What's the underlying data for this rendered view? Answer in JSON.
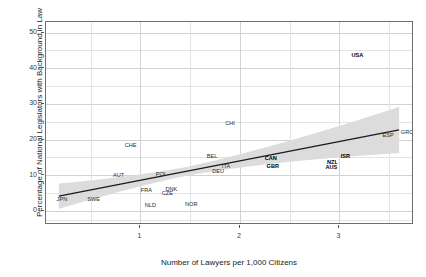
{
  "chart_data": {
    "type": "scatter",
    "title": "",
    "xlabel": "Number of Lawyers per 1,000 Citizens",
    "ylabel": "Percentage of National Legislators with Background in Law",
    "xlim": [
      0.05,
      3.75
    ],
    "ylim": [
      -4,
      53
    ],
    "xticks": [
      1,
      2,
      3
    ],
    "yticks": [
      0,
      10,
      20,
      30,
      40,
      50
    ],
    "xtick_labels": [
      "1",
      "2",
      "3"
    ],
    "ytick_labels": [
      "0",
      "10",
      "20",
      "30",
      "40",
      "50"
    ],
    "grid": true,
    "legend": "none",
    "point_style": "text-labels",
    "fit_line": {
      "type": "linear",
      "x": [
        0.18,
        3.62
      ],
      "y": [
        3.6,
        22.4
      ],
      "color": "#1a1a1a",
      "confidence_band": true,
      "band_color": "#d8d8d8"
    },
    "points": [
      {
        "label": "JPN",
        "x": 0.21,
        "y": 3.1,
        "bold": false
      },
      {
        "label": "SWE",
        "x": 0.53,
        "y": 3.0,
        "bold": false
      },
      {
        "label": "AUT",
        "x": 0.78,
        "y": 9.8,
        "bold": false
      },
      {
        "label": "CHE",
        "x": 0.9,
        "y": 18.1,
        "bold": false
      },
      {
        "label": "FRA",
        "x": 1.06,
        "y": 5.5,
        "bold": false
      },
      {
        "label": "NLD",
        "x": 1.1,
        "y": 1.4,
        "bold": false
      },
      {
        "label": "POL",
        "x": 1.21,
        "y": 9.9,
        "bold": false
      },
      {
        "label": "CZE",
        "x": 1.27,
        "y": 4.8,
        "bold": false
      },
      {
        "label": "DNK",
        "x": 1.31,
        "y": 5.7,
        "bold": false
      },
      {
        "label": "NOR",
        "x": 1.51,
        "y": 1.6,
        "bold": false
      },
      {
        "label": "BEL",
        "x": 1.72,
        "y": 15.2,
        "bold": false
      },
      {
        "label": "DEU",
        "x": 1.78,
        "y": 11.0,
        "bold": false
      },
      {
        "label": "ITA",
        "x": 1.86,
        "y": 12.3,
        "bold": false
      },
      {
        "label": "CHI",
        "x": 1.9,
        "y": 24.5,
        "bold": false
      },
      {
        "label": "CAN",
        "x": 2.31,
        "y": 14.5,
        "bold": true
      },
      {
        "label": "GBR",
        "x": 2.33,
        "y": 12.2,
        "bold": true
      },
      {
        "label": "AUS",
        "x": 2.92,
        "y": 12.1,
        "bold": true
      },
      {
        "label": "NZL",
        "x": 2.93,
        "y": 13.4,
        "bold": true
      },
      {
        "label": "ISR",
        "x": 3.06,
        "y": 15.0,
        "bold": true
      },
      {
        "label": "USA",
        "x": 3.18,
        "y": 43.4,
        "bold": true
      },
      {
        "label": "ESP",
        "x": 3.49,
        "y": 21.0,
        "bold": false
      },
      {
        "label": "GRC",
        "x": 3.68,
        "y": 21.9,
        "bold": false
      }
    ]
  }
}
